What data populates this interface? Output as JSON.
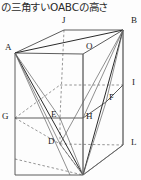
{
  "caption": {
    "text": "の三角すいOABCの高さ"
  },
  "figure": {
    "name": "triangular-pyramid-in-rectangular-prism",
    "stroke_color": "#4a4a4a",
    "dashed_color": "#6a6a6a",
    "bold_color": "#222222",
    "vertices": [
      {
        "id": "J",
        "label": "J",
        "x": 62,
        "y": 6
      },
      {
        "id": "B",
        "label": "B",
        "x": 130,
        "y": 6
      },
      {
        "id": "A",
        "label": "A",
        "x": 9,
        "y": 33
      },
      {
        "id": "O",
        "label": "O",
        "x": 86,
        "y": 32
      },
      {
        "id": "I",
        "label": "I",
        "x": 132,
        "y": 65
      },
      {
        "id": "F",
        "label": "F",
        "x": 111,
        "y": 82
      },
      {
        "id": "G",
        "label": "G",
        "x": 2,
        "y": 93
      },
      {
        "id": "E",
        "label": "E",
        "x": 51,
        "y": 96
      },
      {
        "id": "H",
        "label": "H",
        "x": 87,
        "y": 96
      },
      {
        "id": "D",
        "label": "D",
        "x": 48,
        "y": 124
      },
      {
        "id": "L",
        "label": "L",
        "x": 131,
        "y": 126
      }
    ],
    "geometry": {
      "points": {
        "A": [
          15,
          39
        ],
        "J": [
          64,
          16
        ],
        "B": [
          123,
          16
        ],
        "O": [
          83,
          40
        ],
        "Gt": [
          15,
          104
        ],
        "Et": [
          60,
          104
        ],
        "Ht": [
          83,
          104
        ],
        "I": [
          123,
          71
        ],
        "F": [
          106,
          88
        ],
        "D": [
          60,
          130
        ],
        "L": [
          123,
          131
        ],
        "K": [
          15,
          161
        ],
        "C": [
          83,
          161
        ],
        "Rb": [
          123,
          131
        ],
        "Tc": [
          83,
          40
        ]
      },
      "solid_edges": [
        [
          "A",
          "J"
        ],
        [
          "J",
          "B"
        ],
        [
          "A",
          "O"
        ],
        [
          "O",
          "B"
        ],
        [
          "A",
          "Gt"
        ],
        [
          "Gt",
          "K"
        ],
        [
          "K",
          "C"
        ],
        [
          "C",
          "Ht"
        ],
        [
          "Ht",
          "O"
        ],
        [
          "B",
          "I"
        ],
        [
          "I",
          "L"
        ],
        [
          "L",
          "C"
        ],
        [
          "Gt",
          "Ht"
        ],
        [
          "Ht",
          "Et"
        ],
        [
          "O",
          "F"
        ],
        [
          "F",
          "I"
        ]
      ],
      "dashed_edges": [
        [
          "J",
          "Et"
        ],
        [
          "Et",
          "D"
        ],
        [
          "Gt",
          "D"
        ],
        [
          "D",
          "L"
        ],
        [
          "K",
          "C"
        ],
        [
          "Et",
          "Ht"
        ],
        [
          "Ht",
          "I"
        ]
      ],
      "pyramid_edges": [
        [
          "A",
          "B"
        ],
        [
          "A",
          "C"
        ],
        [
          "B",
          "C"
        ],
        [
          "O",
          "C"
        ],
        [
          "A",
          "D"
        ],
        [
          "B",
          "D"
        ],
        [
          "B",
          "F"
        ],
        [
          "B",
          "L"
        ],
        [
          "B",
          "H"
        ]
      ]
    }
  }
}
